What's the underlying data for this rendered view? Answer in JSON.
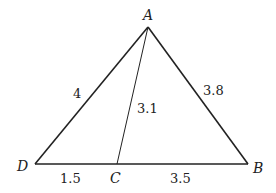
{
  "diagram": {
    "type": "triangle",
    "points": {
      "A": {
        "label": "A",
        "x": 148,
        "y": 27
      },
      "B": {
        "label": "B",
        "x": 248,
        "y": 164
      },
      "C": {
        "label": "C",
        "x": 117,
        "y": 164
      },
      "D": {
        "label": "D",
        "x": 35,
        "y": 164
      }
    },
    "segments": {
      "AD": {
        "label": "4"
      },
      "AB": {
        "label": "3.8"
      },
      "AC": {
        "label": "3.1"
      },
      "DC": {
        "label": "1.5"
      },
      "CB": {
        "label": "3.5"
      }
    },
    "colors": {
      "stroke": "#222222",
      "background": "#ffffff"
    }
  }
}
